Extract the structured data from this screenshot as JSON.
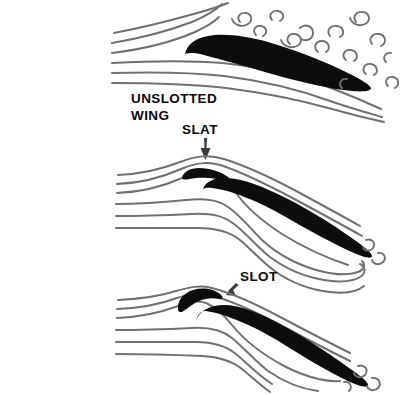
{
  "figure": {
    "title_text_visible": false,
    "background_color": "#ffffff",
    "ink_color": "#0d0d0d",
    "streamline_color": "#6f7275"
  },
  "labels": {
    "unslotted_line1": "UNSLOTTED",
    "unslotted_line2": "WING",
    "slat": "SLAT",
    "slot": "SLOT"
  },
  "panels": [
    {
      "id": "panel-unslotted-wing",
      "label_lines": [
        "UNSLOTTED",
        "WING"
      ],
      "has_slat": false,
      "flow_state": "separated-turbulent",
      "streamline_count": 6,
      "turbulence_curl_count": 14
    },
    {
      "id": "panel-slat",
      "label_lines": [
        "SLAT"
      ],
      "has_slat": true,
      "flow_state": "attached-smooth",
      "streamline_count": 6,
      "turbulence_curl_count": 2
    },
    {
      "id": "panel-slot",
      "label_lines": [
        "SLOT"
      ],
      "has_slat": true,
      "flow_state": "attached-smooth",
      "streamline_count": 6,
      "turbulence_curl_count": 3
    }
  ]
}
